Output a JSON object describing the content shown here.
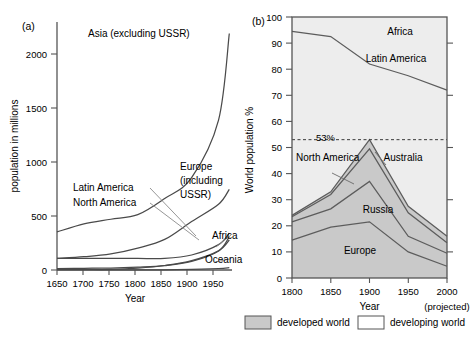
{
  "figure": {
    "panels": [
      {
        "tag": "(a)",
        "xlabel": "Year",
        "ylabel": "population in millions",
        "xticks": [
          "1650",
          "1700",
          "1750",
          "1800",
          "1850",
          "1900",
          "1950"
        ],
        "yticks": [
          "0",
          "500",
          "1000",
          "1500",
          "2000"
        ],
        "labels": [
          "Asia (excluding USSR)",
          "Latin America",
          "North America",
          "Europe",
          "(including",
          "USSR)",
          "Africa",
          "Oceania"
        ]
      },
      {
        "tag": "(b)",
        "xlabel": "Year",
        "ylabel": "World population %",
        "xticks": [
          "1800",
          "1850",
          "1900",
          "1950",
          "2000"
        ],
        "yticks": [
          "0",
          "10",
          "20",
          "30",
          "40",
          "50",
          "60",
          "70",
          "80",
          "90",
          "100"
        ],
        "projected_note": "(projected)",
        "annotation": "53%",
        "labels": [
          "Africa",
          "Latin America",
          "North America",
          "Australia",
          "Russia",
          "Europe"
        ]
      }
    ],
    "legend": [
      {
        "label": "developed world",
        "color": "#c8c8c8"
      },
      {
        "label": "developing world",
        "color": "#ffffff"
      }
    ]
  },
  "chart_data": [
    {
      "type": "line",
      "panel": "(a)",
      "title": "",
      "xlabel": "Year",
      "ylabel": "population in millions",
      "xlim": [
        1650,
        1975
      ],
      "ylim": [
        0,
        2150
      ],
      "grid": false,
      "x": [
        1650,
        1700,
        1750,
        1800,
        1850,
        1900,
        1950,
        1970
      ],
      "series": [
        {
          "name": "Asia (excluding USSR)",
          "values": [
            330,
            400,
            440,
            480,
            620,
            800,
            1300,
            2050
          ]
        },
        {
          "name": "Europe (including USSR)",
          "values": [
            100,
            115,
            140,
            190,
            265,
            420,
            570,
            700
          ]
        },
        {
          "name": "Africa",
          "values": [
            100,
            100,
            100,
            100,
            100,
            130,
            220,
            320
          ]
        },
        {
          "name": "Latin America",
          "values": [
            12,
            15,
            16,
            24,
            38,
            74,
            165,
            290
          ]
        },
        {
          "name": "North America",
          "values": [
            5,
            5,
            5,
            16,
            39,
            81,
            166,
            260
          ]
        },
        {
          "name": "Oceania",
          "values": [
            2,
            2,
            2,
            2,
            2,
            6,
            13,
            20
          ]
        }
      ]
    },
    {
      "type": "area",
      "panel": "(b)",
      "title": "",
      "xlabel": "Year",
      "ylabel": "World population %",
      "xlim": [
        1800,
        2000
      ],
      "ylim": [
        0,
        100
      ],
      "grid": false,
      "stacked": true,
      "x": [
        1800,
        1850,
        1900,
        1950,
        2000
      ],
      "annotations": [
        {
          "text": "53%",
          "y": 53,
          "style": "dashed-line"
        }
      ],
      "series": [
        {
          "name": "Europe",
          "values": [
            14.5,
            19.5,
            21.5,
            10.0,
            4.5
          ],
          "group": "developed"
        },
        {
          "name": "Russia",
          "values": [
            7.0,
            7.0,
            15.5,
            6.0,
            5.0
          ],
          "group": "developed"
        },
        {
          "name": "North America",
          "values": [
            2.0,
            5.5,
            12.5,
            9.0,
            4.0
          ],
          "group": "developed"
        },
        {
          "name": "Australia",
          "values": [
            0.5,
            1.0,
            3.5,
            2.5,
            2.5
          ],
          "group": "developed"
        },
        {
          "name": "Latin America",
          "values": [
            70.5,
            59.5,
            29.0,
            50.0,
            56.0
          ],
          "group": "developing"
        },
        {
          "name": "Africa",
          "values": [
            5.5,
            7.5,
            18.0,
            22.5,
            28.0
          ],
          "group": "developing"
        }
      ],
      "cumulative_boundaries": {
        "europe_top": [
          14.5,
          19.5,
          21.5,
          10.0,
          4.5
        ],
        "russia_top": [
          21.5,
          26.5,
          37.0,
          16.0,
          9.5
        ],
        "north_america_top": [
          23.5,
          32.0,
          49.5,
          25.0,
          13.5
        ],
        "australia_top": [
          24.0,
          33.0,
          53.0,
          27.5,
          16.0
        ],
        "latin_america_top": [
          94.5,
          92.5,
          82.0,
          77.5,
          72.0
        ],
        "africa_top": [
          100,
          100,
          100,
          100,
          100
        ]
      }
    }
  ]
}
